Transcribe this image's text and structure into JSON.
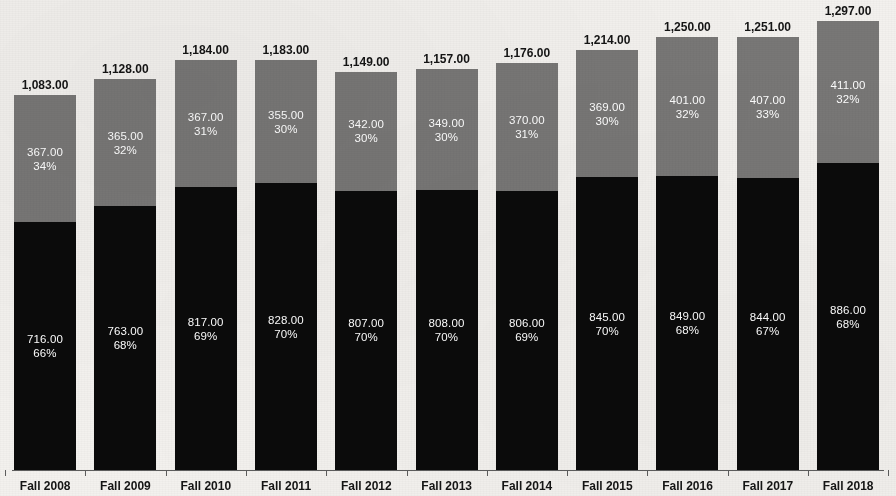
{
  "chart_data": {
    "type": "bar",
    "subtype": "stacked-bar-with-data-labels",
    "title": "",
    "subtitle": "",
    "xlabel": "",
    "ylabel": "",
    "grid": false,
    "legend": "none",
    "axis": {
      "x_ticks_visible": true,
      "y_axis_visible": false,
      "ylim": [
        0,
        1297
      ]
    },
    "categories": [
      "Fall 2008",
      "Fall 2009",
      "Fall 2010",
      "Fall 2011",
      "Fall 2012",
      "Fall 2013",
      "Fall 2014",
      "Fall 2015",
      "Fall 2016",
      "Fall 2017",
      "Fall 2018"
    ],
    "series": [
      {
        "name": "bottom-segment",
        "color": "#0b0b0b",
        "values": [
          716,
          763,
          817,
          828,
          807,
          808,
          806,
          845,
          849,
          844,
          886
        ],
        "value_labels": [
          "716.00",
          "763.00",
          "817.00",
          "828.00",
          "807.00",
          "808.00",
          "806.00",
          "845.00",
          "849.00",
          "844.00",
          "886.00"
        ],
        "percent_labels": [
          "66%",
          "68%",
          "69%",
          "70%",
          "70%",
          "70%",
          "69%",
          "70%",
          "68%",
          "67%",
          "68%"
        ]
      },
      {
        "name": "top-segment",
        "color": "#787776",
        "values": [
          367,
          365,
          367,
          355,
          342,
          349,
          370,
          369,
          401,
          407,
          411
        ],
        "value_labels": [
          "367.00",
          "365.00",
          "367.00",
          "355.00",
          "342.00",
          "349.00",
          "370.00",
          "369.00",
          "401.00",
          "407.00",
          "411.00"
        ],
        "percent_labels": [
          "34%",
          "32%",
          "31%",
          "30%",
          "30%",
          "30%",
          "31%",
          "30%",
          "32%",
          "33%",
          "32%"
        ]
      }
    ],
    "totals": [
      1083,
      1128,
      1184,
      1183,
      1149,
      1157,
      1176,
      1214,
      1250,
      1251,
      1297
    ],
    "total_labels": [
      "1,083.00",
      "1,128.00",
      "1,184.00",
      "1,183.00",
      "1,149.00",
      "1,157.00",
      "1,176.00",
      "1,214.00",
      "1,250.00",
      "1,251.00",
      "1,297.00"
    ]
  },
  "colors": {
    "background": "#f3f1ee",
    "bottom_segment": "#0b0b0b",
    "top_segment": "#787776",
    "label_dark": "#141414",
    "label_light": "#ffffff",
    "axis": "#5d5d5d"
  },
  "layout": {
    "bar_width_px": 62,
    "bar_pitch_px": 80.3,
    "first_bar_left_px": 14,
    "baseline_y_px": 470,
    "px_per_unit": 0.3462
  }
}
